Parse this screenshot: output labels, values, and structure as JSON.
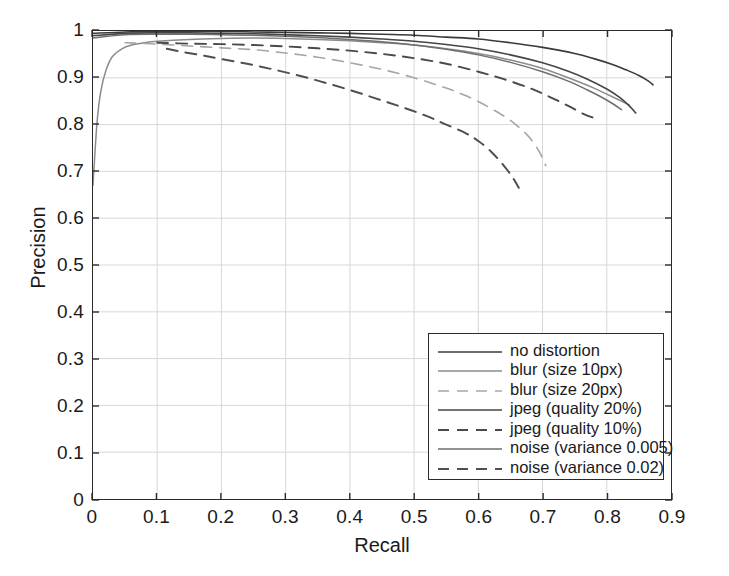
{
  "chart_data": {
    "type": "line",
    "title": "",
    "xlabel": "Recall",
    "ylabel": "Precision",
    "xlim": [
      0,
      0.9
    ],
    "ylim": [
      0,
      1
    ],
    "xticks": [
      "0",
      "0.1",
      "0.2",
      "0.3",
      "0.4",
      "0.5",
      "0.6",
      "0.7",
      "0.8",
      "0.9"
    ],
    "yticks": [
      "0",
      "0.1",
      "0.2",
      "0.3",
      "0.4",
      "0.5",
      "0.6",
      "0.7",
      "0.8",
      "0.9",
      "1"
    ],
    "grid": true,
    "legend_position": "lower right",
    "series": [
      {
        "name": "no distortion",
        "color": "#3a3a3a",
        "dash": "none",
        "width": 1.6,
        "points": [
          [
            0.0,
            0.995
          ],
          [
            0.05,
            0.998
          ],
          [
            0.1,
            0.999
          ],
          [
            0.15,
            0.999
          ],
          [
            0.2,
            0.999
          ],
          [
            0.25,
            0.998
          ],
          [
            0.3,
            0.997
          ],
          [
            0.35,
            0.996
          ],
          [
            0.4,
            0.995
          ],
          [
            0.45,
            0.993
          ],
          [
            0.5,
            0.991
          ],
          [
            0.55,
            0.987
          ],
          [
            0.6,
            0.983
          ],
          [
            0.65,
            0.975
          ],
          [
            0.7,
            0.965
          ],
          [
            0.75,
            0.952
          ],
          [
            0.78,
            0.941
          ],
          [
            0.81,
            0.928
          ],
          [
            0.83,
            0.917
          ],
          [
            0.85,
            0.905
          ],
          [
            0.865,
            0.893
          ],
          [
            0.872,
            0.885
          ]
        ]
      },
      {
        "name": "blur (size 10px)",
        "color": "#8c8c8c",
        "dash": "none",
        "width": 1.5,
        "points": [
          [
            0.0,
            0.67
          ],
          [
            0.006,
            0.8
          ],
          [
            0.012,
            0.87
          ],
          [
            0.02,
            0.915
          ],
          [
            0.03,
            0.945
          ],
          [
            0.045,
            0.962
          ],
          [
            0.06,
            0.97
          ],
          [
            0.08,
            0.975
          ],
          [
            0.1,
            0.978
          ],
          [
            0.15,
            0.982
          ],
          [
            0.2,
            0.984
          ],
          [
            0.25,
            0.985
          ],
          [
            0.3,
            0.984
          ],
          [
            0.35,
            0.982
          ],
          [
            0.4,
            0.979
          ],
          [
            0.45,
            0.975
          ],
          [
            0.5,
            0.97
          ],
          [
            0.55,
            0.962
          ],
          [
            0.6,
            0.952
          ],
          [
            0.65,
            0.938
          ],
          [
            0.7,
            0.92
          ],
          [
            0.74,
            0.9
          ],
          [
            0.78,
            0.878
          ],
          [
            0.8,
            0.865
          ],
          [
            0.82,
            0.852
          ],
          [
            0.835,
            0.842
          ]
        ]
      },
      {
        "name": "blur (size 20px)",
        "color": "#a6a6a6",
        "dash": "dashed",
        "width": 1.6,
        "points": [
          [
            0.05,
            0.975
          ],
          [
            0.1,
            0.972
          ],
          [
            0.15,
            0.968
          ],
          [
            0.2,
            0.964
          ],
          [
            0.25,
            0.96
          ],
          [
            0.3,
            0.953
          ],
          [
            0.35,
            0.944
          ],
          [
            0.4,
            0.932
          ],
          [
            0.45,
            0.918
          ],
          [
            0.5,
            0.9
          ],
          [
            0.55,
            0.878
          ],
          [
            0.58,
            0.862
          ],
          [
            0.61,
            0.842
          ],
          [
            0.64,
            0.818
          ],
          [
            0.66,
            0.798
          ],
          [
            0.68,
            0.772
          ],
          [
            0.695,
            0.742
          ],
          [
            0.705,
            0.712
          ]
        ]
      },
      {
        "name": "jpeg (quality 20%)",
        "color": "#454545",
        "dash": "none",
        "width": 1.6,
        "points": [
          [
            0.0,
            0.99
          ],
          [
            0.05,
            0.995
          ],
          [
            0.1,
            0.996
          ],
          [
            0.15,
            0.996
          ],
          [
            0.2,
            0.995
          ],
          [
            0.25,
            0.994
          ],
          [
            0.3,
            0.992
          ],
          [
            0.35,
            0.99
          ],
          [
            0.4,
            0.987
          ],
          [
            0.45,
            0.983
          ],
          [
            0.5,
            0.978
          ],
          [
            0.55,
            0.971
          ],
          [
            0.6,
            0.962
          ],
          [
            0.65,
            0.949
          ],
          [
            0.7,
            0.932
          ],
          [
            0.74,
            0.914
          ],
          [
            0.77,
            0.897
          ],
          [
            0.8,
            0.876
          ],
          [
            0.82,
            0.858
          ],
          [
            0.835,
            0.84
          ],
          [
            0.845,
            0.825
          ]
        ]
      },
      {
        "name": "jpeg (quality 10%)",
        "color": "#4a4a4a",
        "dash": "dashed",
        "width": 1.9,
        "points": [
          [
            0.1,
            0.975
          ],
          [
            0.15,
            0.973
          ],
          [
            0.2,
            0.972
          ],
          [
            0.25,
            0.97
          ],
          [
            0.3,
            0.967
          ],
          [
            0.35,
            0.963
          ],
          [
            0.4,
            0.958
          ],
          [
            0.45,
            0.951
          ],
          [
            0.5,
            0.942
          ],
          [
            0.55,
            0.93
          ],
          [
            0.6,
            0.913
          ],
          [
            0.64,
            0.897
          ],
          [
            0.68,
            0.878
          ],
          [
            0.71,
            0.86
          ],
          [
            0.74,
            0.84
          ],
          [
            0.765,
            0.822
          ],
          [
            0.785,
            0.812
          ]
        ]
      },
      {
        "name": "noise (variance 0.005)",
        "color": "#6e6e6e",
        "dash": "none",
        "width": 1.5,
        "points": [
          [
            0.0,
            0.985
          ],
          [
            0.05,
            0.992
          ],
          [
            0.1,
            0.993
          ],
          [
            0.15,
            0.993
          ],
          [
            0.2,
            0.992
          ],
          [
            0.25,
            0.991
          ],
          [
            0.3,
            0.989
          ],
          [
            0.35,
            0.986
          ],
          [
            0.4,
            0.982
          ],
          [
            0.45,
            0.977
          ],
          [
            0.5,
            0.97
          ],
          [
            0.55,
            0.961
          ],
          [
            0.6,
            0.949
          ],
          [
            0.65,
            0.933
          ],
          [
            0.7,
            0.913
          ],
          [
            0.74,
            0.893
          ],
          [
            0.77,
            0.874
          ],
          [
            0.79,
            0.86
          ],
          [
            0.81,
            0.844
          ],
          [
            0.823,
            0.832
          ]
        ]
      },
      {
        "name": "noise (variance 0.02)",
        "color": "#4f4f4f",
        "dash": "dashed",
        "width": 2.0,
        "points": [
          [
            0.115,
            0.962
          ],
          [
            0.14,
            0.955
          ],
          [
            0.17,
            0.948
          ],
          [
            0.2,
            0.94
          ],
          [
            0.24,
            0.93
          ],
          [
            0.28,
            0.918
          ],
          [
            0.32,
            0.905
          ],
          [
            0.36,
            0.89
          ],
          [
            0.4,
            0.874
          ],
          [
            0.44,
            0.856
          ],
          [
            0.48,
            0.838
          ],
          [
            0.52,
            0.818
          ],
          [
            0.55,
            0.8
          ],
          [
            0.58,
            0.782
          ],
          [
            0.6,
            0.765
          ],
          [
            0.62,
            0.742
          ],
          [
            0.638,
            0.715
          ],
          [
            0.652,
            0.69
          ],
          [
            0.663,
            0.665
          ]
        ]
      }
    ]
  },
  "axes": {
    "xlabel": "Recall",
    "ylabel": "Precision"
  },
  "legend": {
    "items": [
      {
        "label": "no distortion"
      },
      {
        "label": "blur (size 10px)"
      },
      {
        "label": "blur (size 20px)"
      },
      {
        "label": "jpeg (quality 20%)"
      },
      {
        "label": "jpeg (quality 10%)"
      },
      {
        "label": "noise (variance 0.005)"
      },
      {
        "label": "noise (variance 0.02)"
      }
    ]
  },
  "colors": {
    "frame": "#2b2b2b",
    "grid": "#d8d8d8",
    "background": "#ffffff"
  }
}
